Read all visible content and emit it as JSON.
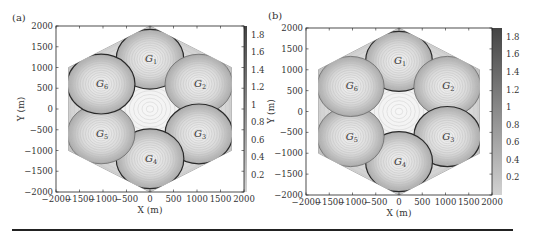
{
  "chart_data": [
    {
      "type": "heatmap",
      "panel_label": "(a)",
      "title": "",
      "xlabel": "X (m)",
      "ylabel": "Y (m)",
      "xlim": [
        -2000,
        2000
      ],
      "ylim": [
        -2000,
        2000
      ],
      "xticks": [
        -2000,
        -1500,
        -1000,
        -500,
        0,
        500,
        1000,
        1500,
        2000
      ],
      "yticks": [
        -2000,
        -1500,
        -1000,
        -500,
        0,
        500,
        1000,
        1500,
        2000
      ],
      "colorbar": {
        "ticks": [
          0.2,
          0.4,
          0.6,
          0.8,
          1,
          1.2,
          1.4,
          1.6,
          1.8
        ],
        "range": [
          0,
          1.9
        ],
        "colormap": "gray",
        "top_color": "#4a4a4a",
        "bottom_color": "#cfcfcf"
      },
      "grid": false,
      "cell_shape": "hexagon",
      "hexagon_radius_m": 2000,
      "groups": [
        {
          "name": "G",
          "sub": "1",
          "cx": 0,
          "cy": 1200,
          "r": 720,
          "outline": "dark"
        },
        {
          "name": "G",
          "sub": "2",
          "cx": 1040,
          "cy": 600,
          "r": 720,
          "outline": "light"
        },
        {
          "name": "G",
          "sub": "3",
          "cx": 1040,
          "cy": -600,
          "r": 720,
          "outline": "dark"
        },
        {
          "name": "G",
          "sub": "4",
          "cx": 0,
          "cy": -1200,
          "r": 720,
          "outline": "dark"
        },
        {
          "name": "G",
          "sub": "5",
          "cx": -1040,
          "cy": -600,
          "r": 720,
          "outline": "light"
        },
        {
          "name": "G",
          "sub": "6",
          "cx": -1040,
          "cy": 600,
          "r": 720,
          "outline": "dark"
        }
      ]
    },
    {
      "type": "heatmap",
      "panel_label": "(b)",
      "title": "",
      "xlabel": "X (m)",
      "ylabel": "Y (m)",
      "xlim": [
        -2000,
        2000
      ],
      "ylim": [
        -2000,
        2000
      ],
      "xticks": [
        -2000,
        -1500,
        -1000,
        -500,
        0,
        500,
        1000,
        1500,
        2000
      ],
      "yticks": [
        -2000,
        -1500,
        -1000,
        -500,
        0,
        500,
        1000,
        1500,
        2000
      ],
      "colorbar": {
        "ticks": [
          0.2,
          0.4,
          0.6,
          0.8,
          1,
          1.2,
          1.4,
          1.6,
          1.8
        ],
        "range": [
          0,
          1.9
        ],
        "colormap": "gray",
        "top_color": "#4a4a4a",
        "bottom_color": "#cfcfcf"
      },
      "grid": false,
      "cell_shape": "hexagon",
      "hexagon_radius_m": 2000,
      "groups": [
        {
          "name": "G",
          "sub": "1",
          "cx": 0,
          "cy": 1200,
          "r": 720,
          "outline": "dark"
        },
        {
          "name": "G",
          "sub": "2",
          "cx": 1040,
          "cy": 600,
          "r": 720,
          "outline": "light"
        },
        {
          "name": "G",
          "sub": "3",
          "cx": 1040,
          "cy": -600,
          "r": 720,
          "outline": "dark"
        },
        {
          "name": "G",
          "sub": "4",
          "cx": 0,
          "cy": -1200,
          "r": 720,
          "outline": "dark"
        },
        {
          "name": "G",
          "sub": "5",
          "cx": -1040,
          "cy": -600,
          "r": 720,
          "outline": "light"
        },
        {
          "name": "G",
          "sub": "6",
          "cx": -1040,
          "cy": 600,
          "r": 720,
          "outline": "light"
        }
      ]
    }
  ],
  "layout": {
    "panels": [
      {
        "plot": {
          "x0": 56,
          "y0": 26,
          "x1": 244,
          "y1": 192
        },
        "colorbar": {
          "x0": 236,
          "x1": 247
        },
        "label_pos": [
          12,
          21
        ]
      },
      {
        "plot": {
          "x0": 306,
          "y0": 28,
          "x1": 492,
          "y1": 195
        },
        "colorbar": {
          "x0": 490,
          "x1": 502
        },
        "label_pos": [
          268,
          19
        ]
      }
    ],
    "rule": {
      "x0": 12,
      "x1": 513,
      "y": 230
    }
  }
}
